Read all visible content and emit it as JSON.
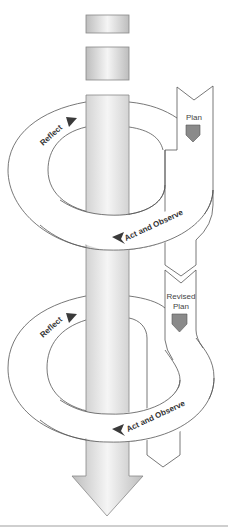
{
  "diagram": {
    "type": "action-research-spiral",
    "cycles": [
      {
        "plan_label": "Plan",
        "reflect_label": "Reflect",
        "act_observe_label": "Act and Observe"
      },
      {
        "plan_label_line1": "Revised",
        "plan_label_line2": "Plan",
        "reflect_label": "Reflect",
        "act_observe_label": "Act and Observe"
      }
    ],
    "colors": {
      "stroke": "#555555",
      "column_edge": "#b8b8b8",
      "column_mid": "#f4f4f4",
      "shield_fill": "#8a8a8a",
      "arrow_fill": "#3a3a3a",
      "baseline": "#cfcfcf"
    }
  }
}
